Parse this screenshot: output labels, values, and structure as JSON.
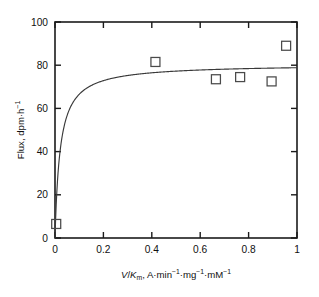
{
  "chart_data": {
    "type": "scatter",
    "title": "",
    "subtitle": "",
    "xlabel": "V/Km, A·min-1·mg-1·mM-1",
    "xlabel_parts": {
      "v": "V",
      "slash": "/",
      "k": "K",
      "k_sub": "m",
      "rest_a": ", A",
      "dot1": "·",
      "min": "min",
      "exp1": "−1",
      "dot2": "·",
      "mg": "mg",
      "exp2": "−1",
      "dot3": "·",
      "mm": "mM",
      "exp3": "−1"
    },
    "ylabel": "Flux, dpm·h-1",
    "ylabel_parts": {
      "flux": "Flux, dpm",
      "dot": "·",
      "h": "h",
      "exp": "−1"
    },
    "xlim": [
      0,
      1
    ],
    "ylim": [
      0,
      100
    ],
    "xticks": [
      0,
      0.2,
      0.4,
      0.6,
      0.8,
      1
    ],
    "xticklabels": [
      "0",
      "0.2",
      "0.4",
      "0.6",
      "0.8",
      "1"
    ],
    "yticks": [
      0,
      20,
      40,
      60,
      80,
      100
    ],
    "yticklabels": [
      "0",
      "20",
      "40",
      "60",
      "80",
      "100"
    ],
    "grid": false,
    "legend": "none",
    "marker": "open-square",
    "marker_color": "#4a4a4a",
    "line_color": "#3a3a3a",
    "frame_color": "#1b1b1b",
    "points": [
      {
        "x": 0.005,
        "y": 6.5
      },
      {
        "x": 0.415,
        "y": 81.5
      },
      {
        "x": 0.665,
        "y": 73.5
      },
      {
        "x": 0.765,
        "y": 74.5
      },
      {
        "x": 0.895,
        "y": 72.5
      },
      {
        "x": 0.955,
        "y": 89.0
      }
    ],
    "fit_curve": {
      "model": "michaelis-menten",
      "equation": "y = Vmax * x / (K + x)",
      "Vmax": 80.5,
      "K": 0.021
    }
  }
}
